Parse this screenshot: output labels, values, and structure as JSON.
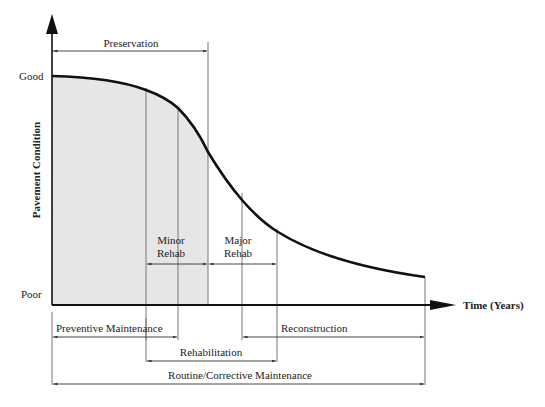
{
  "diagram": {
    "y_axis": {
      "label": "Pavement Condition",
      "top_label": "Good",
      "bottom_label": "Poor"
    },
    "x_axis": {
      "label": "Time (Years)"
    },
    "curve": {
      "description": "Pavement deterioration curve from Good to Poor over time",
      "shaded_region": "Preservation window"
    },
    "brackets": {
      "preservation": "Preservation",
      "minor_rehab_line1": "Minor",
      "minor_rehab_line2": "Rehab",
      "major_rehab_line1": "Major",
      "major_rehab_line2": "Rehab",
      "preventive_maintenance": "Preventive Maintenance",
      "reconstruction": "Reconstruction",
      "rehabilitation": "Rehabilitation",
      "routine_corrective": "Routine/Corrective Maintenance"
    },
    "colors": {
      "curve": "#111111",
      "axis": "#111111",
      "shade": "#e6e6e6",
      "guide_lines": "#777777"
    }
  }
}
